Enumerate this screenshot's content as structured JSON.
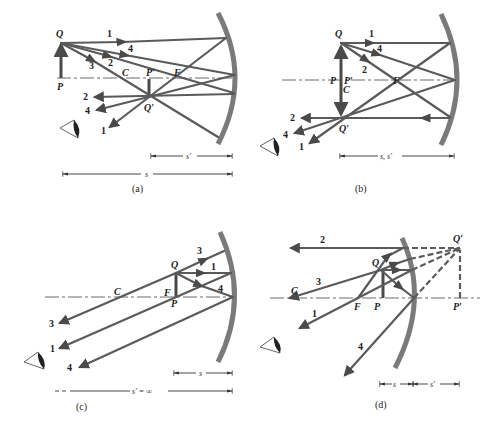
{
  "figure": {
    "colors": {
      "ray": "#5a5a5a",
      "mirror": "#7a7a7a",
      "text": "#222222",
      "background": "#ffffff"
    }
  },
  "panels": [
    {
      "id": "a",
      "caption": "(a)",
      "mirror": "concave",
      "labels": {
        "Q": "Q",
        "P": "P",
        "C": "C",
        "F": "F",
        "P_prime": "P′",
        "Q_prime": "Q′"
      },
      "rays": [
        "1",
        "2",
        "3",
        "4"
      ],
      "out_rays": [
        "2",
        "4",
        "1"
      ],
      "dimensions": {
        "image_distance": "s′",
        "object_distance": "s"
      }
    },
    {
      "id": "b",
      "caption": "(b)",
      "mirror": "concave",
      "labels": {
        "Q": "Q",
        "P": "P",
        "P_prime": "P′",
        "C": "C",
        "F": "F",
        "Q_prime": "Q′"
      },
      "rays": [
        "1",
        "4",
        "2"
      ],
      "out_rays": [
        "2",
        "4",
        "1"
      ],
      "dimensions": {
        "combined": "s, s′"
      }
    },
    {
      "id": "c",
      "caption": "(c)",
      "mirror": "concave",
      "labels": {
        "Q": "Q",
        "P": "P",
        "F": "F",
        "C": "C"
      },
      "rays": [
        "3",
        "1",
        "4"
      ],
      "out_rays": [
        "3",
        "1",
        "4"
      ],
      "dimensions": {
        "object_distance": "s",
        "image_distance": "s′ = ∞"
      }
    },
    {
      "id": "d",
      "caption": "(d)",
      "mirror": "convex",
      "labels": {
        "Q": "Q",
        "P": "P",
        "F": "F",
        "C": "C",
        "Q_prime": "Q′",
        "P_prime": "P′"
      },
      "rays": [
        "2",
        "3",
        "1",
        "4"
      ],
      "out_rays": [
        "2",
        "3",
        "1",
        "4"
      ],
      "dimensions": {
        "object_distance": "s",
        "image_distance": "s′"
      }
    }
  ]
}
